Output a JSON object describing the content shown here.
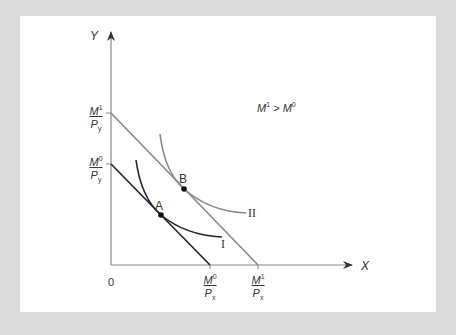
{
  "figure": {
    "title": "",
    "condition_label": {
      "base": "M",
      "sup1": "1",
      "op": " > ",
      "base2": "M",
      "sup2": "0"
    },
    "axes": {
      "y_label": "Y",
      "x_label": "X",
      "origin_label": "0",
      "y_ticks": [
        {
          "num_base": "M",
          "num_sup": "1",
          "den_base": "P",
          "den_sub": "y"
        },
        {
          "num_base": "M",
          "num_sup": "0",
          "den_base": "P",
          "den_sub": "y"
        }
      ],
      "x_ticks": [
        {
          "num_base": "M",
          "num_sup": "0",
          "den_base": "P",
          "den_sub": "x"
        },
        {
          "num_base": "M",
          "num_sup": "1",
          "den_base": "P",
          "den_sub": "x"
        }
      ]
    },
    "points": [
      {
        "label": "A",
        "x": 161,
        "y": 215
      },
      {
        "label": "B",
        "x": 184,
        "y": 189
      }
    ],
    "curves": [
      {
        "label": "I"
      },
      {
        "label": "II"
      }
    ],
    "colors": {
      "background": "#dcdcdc",
      "panel": "#ffffff",
      "budget_line_0": "#222222",
      "budget_line_1": "#888888",
      "indifference_I": "#222222",
      "indifference_II": "#888888",
      "axis": "#888888",
      "text": "#333333"
    }
  }
}
